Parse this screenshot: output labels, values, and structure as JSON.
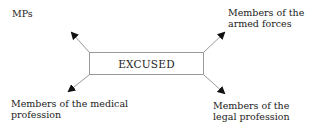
{
  "center": {
    "label": "EXCUSED"
  },
  "nodes": [
    {
      "id": "mps",
      "label_lines": [
        "MPs"
      ]
    },
    {
      "id": "armed-forces",
      "label_lines": [
        "Members of the",
        "armed forces"
      ]
    },
    {
      "id": "medical",
      "label_lines": [
        "Members of the medical",
        "profession"
      ]
    },
    {
      "id": "legal",
      "label_lines": [
        "Members of the",
        "legal profession"
      ]
    }
  ]
}
